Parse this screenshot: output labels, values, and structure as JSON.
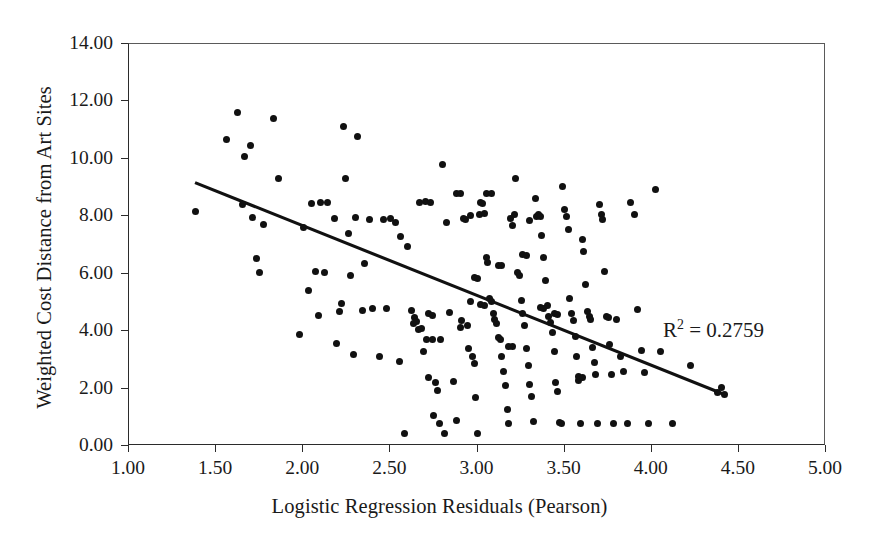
{
  "chart_data": {
    "type": "scatter",
    "title": "",
    "xlabel": "Logistic Regression Residuals (Pearson)",
    "ylabel": "Weighted Cost Distance from Art Sites",
    "xlim": [
      1.0,
      5.0
    ],
    "ylim": [
      0.0,
      14.0
    ],
    "xticks": [
      "1.00",
      "1.50",
      "2.00",
      "2.50",
      "3.00",
      "3.50",
      "4.00",
      "4.50",
      "5.00"
    ],
    "xtick_values": [
      1.0,
      1.5,
      2.0,
      2.5,
      3.0,
      3.5,
      4.0,
      4.5,
      5.0
    ],
    "yticks": [
      "0.00",
      "2.00",
      "4.00",
      "6.00",
      "8.00",
      "10.00",
      "12.00",
      "14.00"
    ],
    "ytick_values": [
      0,
      2,
      4,
      6,
      8,
      10,
      12,
      14
    ],
    "grid": false,
    "legend": null,
    "annotations": [
      {
        "name": "r-squared",
        "text_prefix": "R",
        "text_sup": "2",
        "text_suffix": " = 0.2759",
        "value": 0.2759,
        "x": 4.05,
        "y": 4.55
      }
    ],
    "trendline": {
      "type": "linear",
      "x_start": 1.38,
      "y_start": 9.15,
      "x_end": 4.42,
      "y_end": 1.75,
      "slope": -2.434,
      "intercept": 12.51,
      "r_squared": 0.2759,
      "color": "#111111"
    },
    "marker": {
      "shape": "circle",
      "color": "#111111",
      "size_px": 7
    },
    "points": [
      [
        1.38,
        8.18
      ],
      [
        1.56,
        10.68
      ],
      [
        1.62,
        11.62
      ],
      [
        1.65,
        8.42
      ],
      [
        1.66,
        10.08
      ],
      [
        1.7,
        10.45
      ],
      [
        1.71,
        7.95
      ],
      [
        1.73,
        6.52
      ],
      [
        1.75,
        6.05
      ],
      [
        1.77,
        7.7
      ],
      [
        1.83,
        11.42
      ],
      [
        1.86,
        9.32
      ],
      [
        1.98,
        3.88
      ],
      [
        2.0,
        7.62
      ],
      [
        2.03,
        5.42
      ],
      [
        2.05,
        8.45
      ],
      [
        2.07,
        6.08
      ],
      [
        2.09,
        4.55
      ],
      [
        2.1,
        8.48
      ],
      [
        2.12,
        6.05
      ],
      [
        2.14,
        8.48
      ],
      [
        2.18,
        7.92
      ],
      [
        2.19,
        3.58
      ],
      [
        2.21,
        4.7
      ],
      [
        2.22,
        4.98
      ],
      [
        2.23,
        11.12
      ],
      [
        2.24,
        9.32
      ],
      [
        2.26,
        7.4
      ],
      [
        2.27,
        5.95
      ],
      [
        2.29,
        3.18
      ],
      [
        2.31,
        10.78
      ],
      [
        2.34,
        4.72
      ],
      [
        2.38,
        7.9
      ],
      [
        2.4,
        4.78
      ],
      [
        2.46,
        7.88
      ],
      [
        2.5,
        7.92
      ],
      [
        2.55,
        2.95
      ],
      [
        2.56,
        7.28
      ],
      [
        2.58,
        0.42
      ],
      [
        2.6,
        6.95
      ],
      [
        2.62,
        4.72
      ],
      [
        2.63,
        4.28
      ],
      [
        2.64,
        4.48
      ],
      [
        2.65,
        4.35
      ],
      [
        2.66,
        4.05
      ],
      [
        2.67,
        8.48
      ],
      [
        2.68,
        4.1
      ],
      [
        2.69,
        3.3
      ],
      [
        2.7,
        8.52
      ],
      [
        2.71,
        3.7
      ],
      [
        2.72,
        2.4
      ],
      [
        2.73,
        8.48
      ],
      [
        2.74,
        3.72
      ],
      [
        2.75,
        1.05
      ],
      [
        2.76,
        2.2
      ],
      [
        2.77,
        1.95
      ],
      [
        2.78,
        0.8
      ],
      [
        2.79,
        3.7
      ],
      [
        2.8,
        9.82
      ],
      [
        2.81,
        0.42
      ],
      [
        2.82,
        7.8
      ],
      [
        2.84,
        4.65
      ],
      [
        2.86,
        2.25
      ],
      [
        2.88,
        0.88
      ],
      [
        2.9,
        4.12
      ],
      [
        2.91,
        4.38
      ],
      [
        2.92,
        7.92
      ],
      [
        2.93,
        7.9
      ],
      [
        2.94,
        4.18
      ],
      [
        2.95,
        3.4
      ],
      [
        2.96,
        5.02
      ],
      [
        2.97,
        3.1
      ],
      [
        2.98,
        2.88
      ],
      [
        2.99,
        1.68
      ],
      [
        3.0,
        0.42
      ],
      [
        3.01,
        8.05
      ],
      [
        3.02,
        8.48
      ],
      [
        3.03,
        8.45
      ],
      [
        3.04,
        8.1
      ],
      [
        3.05,
        6.55
      ],
      [
        3.06,
        6.38
      ],
      [
        3.07,
        5.15
      ],
      [
        3.08,
        5.02
      ],
      [
        3.09,
        4.6
      ],
      [
        3.1,
        4.42
      ],
      [
        3.11,
        4.28
      ],
      [
        3.12,
        3.78
      ],
      [
        3.13,
        3.7
      ],
      [
        3.14,
        3.12
      ],
      [
        3.15,
        2.6
      ],
      [
        3.16,
        2.1
      ],
      [
        3.17,
        1.28
      ],
      [
        3.18,
        0.8
      ],
      [
        3.19,
        7.92
      ],
      [
        3.2,
        7.68
      ],
      [
        3.21,
        8.05
      ],
      [
        3.22,
        9.3
      ],
      [
        3.23,
        6.05
      ],
      [
        3.24,
        5.95
      ],
      [
        3.25,
        5.05
      ],
      [
        3.26,
        4.62
      ],
      [
        3.27,
        4.18
      ],
      [
        3.28,
        3.38
      ],
      [
        3.29,
        2.82
      ],
      [
        3.3,
        2.15
      ],
      [
        3.31,
        1.72
      ],
      [
        3.32,
        0.85
      ],
      [
        3.33,
        8.62
      ],
      [
        3.34,
        8.0
      ],
      [
        3.35,
        8.05
      ],
      [
        3.36,
        7.98
      ],
      [
        3.37,
        7.32
      ],
      [
        3.38,
        6.55
      ],
      [
        3.39,
        5.78
      ],
      [
        3.4,
        4.88
      ],
      [
        3.41,
        4.52
      ],
      [
        3.42,
        4.3
      ],
      [
        3.43,
        3.95
      ],
      [
        3.44,
        3.3
      ],
      [
        3.45,
        2.22
      ],
      [
        3.46,
        1.9
      ],
      [
        3.47,
        0.82
      ],
      [
        3.48,
        0.8
      ],
      [
        3.49,
        9.05
      ],
      [
        3.5,
        8.22
      ],
      [
        3.51,
        8.0
      ],
      [
        3.52,
        7.55
      ],
      [
        3.53,
        5.15
      ],
      [
        3.54,
        4.62
      ],
      [
        3.55,
        4.38
      ],
      [
        3.56,
        3.8
      ],
      [
        3.57,
        3.1
      ],
      [
        3.58,
        2.28
      ],
      [
        3.59,
        0.8
      ],
      [
        3.6,
        7.18
      ],
      [
        3.61,
        6.78
      ],
      [
        3.62,
        5.62
      ],
      [
        3.63,
        4.68
      ],
      [
        3.64,
        4.52
      ],
      [
        3.65,
        4.42
      ],
      [
        3.66,
        3.42
      ],
      [
        3.67,
        2.9
      ],
      [
        3.68,
        2.48
      ],
      [
        3.69,
        0.78
      ],
      [
        3.7,
        8.42
      ],
      [
        3.71,
        8.05
      ],
      [
        3.72,
        7.9
      ],
      [
        3.73,
        6.08
      ],
      [
        3.74,
        4.5
      ],
      [
        3.75,
        4.48
      ],
      [
        3.76,
        3.55
      ],
      [
        3.77,
        2.48
      ],
      [
        3.78,
        0.8
      ],
      [
        3.8,
        4.42
      ],
      [
        3.82,
        3.12
      ],
      [
        3.84,
        2.58
      ],
      [
        3.86,
        0.8
      ],
      [
        3.88,
        8.48
      ],
      [
        3.9,
        8.05
      ],
      [
        3.92,
        4.75
      ],
      [
        3.94,
        3.32
      ],
      [
        3.96,
        2.55
      ],
      [
        3.98,
        0.8
      ],
      [
        4.02,
        8.95
      ],
      [
        4.05,
        3.3
      ],
      [
        4.12,
        0.78
      ],
      [
        4.22,
        2.82
      ],
      [
        4.38,
        1.88
      ],
      [
        4.4,
        2.05
      ],
      [
        4.42,
        1.78
      ],
      [
        2.53,
        7.8
      ],
      [
        2.48,
        4.78
      ],
      [
        2.44,
        3.1
      ],
      [
        2.35,
        6.35
      ],
      [
        2.3,
        7.95
      ],
      [
        3.05,
        8.78
      ],
      [
        3.08,
        8.8
      ],
      [
        2.88,
        8.78
      ],
      [
        2.9,
        8.8
      ],
      [
        3.3,
        7.85
      ],
      [
        2.72,
        4.62
      ],
      [
        2.74,
        4.55
      ],
      [
        3.12,
        6.3
      ],
      [
        3.14,
        6.28
      ],
      [
        3.36,
        4.82
      ],
      [
        3.38,
        4.78
      ],
      [
        2.96,
        8.02
      ],
      [
        3.02,
        4.92
      ],
      [
        3.04,
        4.9
      ],
      [
        3.44,
        4.62
      ],
      [
        3.46,
        4.58
      ],
      [
        3.18,
        3.48
      ],
      [
        3.2,
        3.45
      ],
      [
        3.58,
        2.42
      ],
      [
        3.6,
        2.4
      ],
      [
        2.98,
        5.88
      ],
      [
        3.0,
        5.85
      ],
      [
        3.26,
        6.68
      ],
      [
        3.28,
        6.62
      ]
    ]
  },
  "axis": {
    "x_title": "Logistic Regression Residuals (Pearson)",
    "y_title": "Weighted Cost Distance from Art Sites"
  },
  "annotation": {
    "r2_prefix": "R",
    "r2_sup": "2",
    "r2_suffix": " = 0.2759"
  }
}
